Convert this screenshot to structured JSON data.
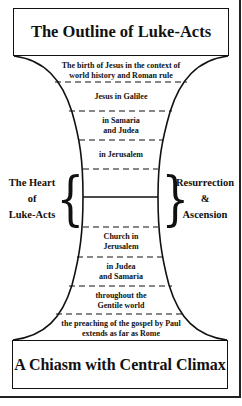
{
  "title": "The Outline of Luke-Acts",
  "footer": "A Chiasm with Central Climax",
  "segments_top": [
    {
      "text": "The birth of Jesus in the context of\nworld history and Roman rule"
    },
    {
      "text": "Jesus in Galilee"
    },
    {
      "text": "in Samaria\nand Judea"
    },
    {
      "text": "in Jerusalem"
    }
  ],
  "segments_bottom": [
    {
      "text": "Church in\nJerusalem"
    },
    {
      "text": "in Judea\nand Samaria"
    },
    {
      "text": "throughout the\nGentile world"
    },
    {
      "text": "the preaching of the gospel by Paul\nextends as far as Rome"
    }
  ],
  "left_label": "The Heart\nof\nLuke-Acts",
  "right_label": "Resurrection\n&\nAscension",
  "icons": {
    "left_brace": "{",
    "right_brace": "}"
  },
  "colors": {
    "line": "#111111",
    "background": "#ffffff"
  }
}
